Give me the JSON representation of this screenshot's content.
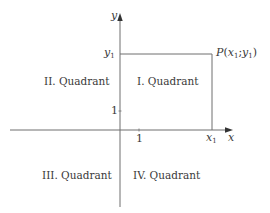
{
  "diagram": {
    "type": "coordinate-system-quadrants",
    "axes": {
      "x_label": "x",
      "y_label": "y",
      "x_tick_label": "1",
      "y_tick_label": "1",
      "x1_label_base": "x",
      "x1_label_sub": "1",
      "y1_label_base": "y",
      "y1_label_sub": "1"
    },
    "point": {
      "name": "P",
      "open": "(",
      "x_base": "x",
      "x_sub": "1",
      "sep": ";",
      "y_base": "y",
      "y_sub": "1",
      "close": ")"
    },
    "quadrants": {
      "q1": "I. Quadrant",
      "q2": "II. Quadrant",
      "q3": "III. Quadrant",
      "q4": "IV. Quadrant"
    },
    "colors": {
      "line": "#6e6e6e",
      "text": "#3a3a3a",
      "background": "#ffffff"
    }
  }
}
